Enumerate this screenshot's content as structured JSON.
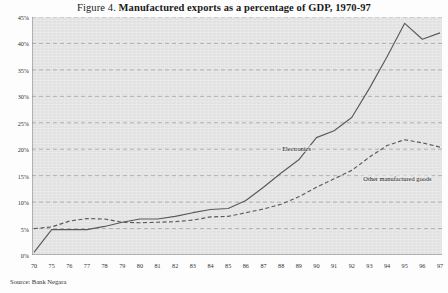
{
  "figure": {
    "label_prefix": "Figure 4.",
    "title": "Manufactured exports as a percentage of GDP, 1970-97",
    "source": "Source: Bank Negara"
  },
  "chart_data": {
    "type": "line",
    "title": "Manufactured exports as a percentage of GDP, 1970-97",
    "xlabel": "",
    "ylabel": "",
    "ylim": [
      0,
      45
    ],
    "ytick_labels": [
      "0%",
      "5%",
      "10%",
      "15%",
      "20%",
      "25%",
      "30%",
      "35%",
      "40%",
      "45%"
    ],
    "ytick_values": [
      0,
      5,
      10,
      15,
      20,
      25,
      30,
      35,
      40,
      45
    ],
    "grid": true,
    "grid_style": "dashed-horizontal",
    "legend": "inline-annotations",
    "categories": [
      "70",
      "75",
      "76",
      "77",
      "78",
      "79",
      "80",
      "81",
      "82",
      "83",
      "84",
      "85",
      "86",
      "87",
      "88",
      "89",
      "90",
      "91",
      "92",
      "93",
      "94",
      "95",
      "96",
      "97"
    ],
    "x": [
      1970,
      1975,
      1976,
      1977,
      1978,
      1979,
      1980,
      1981,
      1982,
      1983,
      1984,
      1985,
      1986,
      1987,
      1988,
      1989,
      1990,
      1991,
      1992,
      1993,
      1994,
      1995,
      1996,
      1997
    ],
    "series": [
      {
        "name": "Electronics",
        "style": "solid",
        "color": "#5a5a5a",
        "values": [
          0.5,
          4.8,
          4.8,
          4.8,
          5.4,
          6.2,
          6.8,
          6.8,
          7.3,
          8.0,
          8.6,
          8.8,
          10.3,
          12.8,
          15.5,
          18.0,
          22.2,
          23.5,
          26.0,
          31.5,
          37.5,
          43.8,
          40.8,
          42.0
        ]
      },
      {
        "name": "Other manufactured goods",
        "style": "dashed",
        "color": "#5a5a5a",
        "values": [
          5.0,
          5.3,
          6.4,
          6.9,
          6.8,
          6.2,
          6.1,
          6.2,
          6.3,
          6.6,
          7.2,
          7.3,
          8.0,
          8.7,
          9.6,
          11.0,
          12.8,
          14.4,
          16.0,
          18.5,
          20.7,
          21.8,
          21.2,
          20.4
        ]
      }
    ],
    "annotations": [
      {
        "text": "Electronics",
        "x": 1988,
        "y": 20.8
      },
      {
        "text": "Other manufactured goods",
        "x": 1992.6,
        "y": 15.2
      }
    ]
  },
  "colors": {
    "plot_background": "#e2e2e2",
    "grid": "#9a9a9a",
    "axis": "#6d6d6d",
    "line": "#5a5a5a",
    "text": "#1a1a1a"
  }
}
